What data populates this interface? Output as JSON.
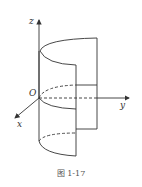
{
  "diagram": {
    "axes": {
      "x_label": "x",
      "y_label": "y",
      "z_label": "z",
      "origin_label": "O"
    },
    "caption": "图 1-17",
    "colors": {
      "stroke": "#333333",
      "caption": "#555555"
    }
  }
}
